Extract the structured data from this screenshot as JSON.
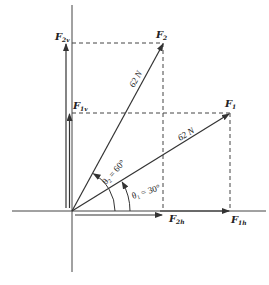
{
  "diagram": {
    "origin_px": [
      72,
      211
    ],
    "colors": {
      "line": "#333333",
      "dashed": "#444444",
      "background": "#ffffff"
    },
    "axes": {
      "x_axis": {
        "from_px": [
          12,
          211
        ],
        "to_px": [
          266,
          211
        ]
      },
      "y_axis": {
        "from_px": [
          72,
          5
        ],
        "to_px": [
          72,
          272
        ]
      }
    },
    "vectors": [
      {
        "name": "F1",
        "label": "F",
        "label_sub": "1",
        "magnitude_label": "62 N",
        "angle_label": "θ",
        "angle_sub": "1",
        "angle_value": " = 30°",
        "tip_px": [
          230,
          113
        ]
      },
      {
        "name": "F2",
        "label": "F",
        "label_sub": "2",
        "magnitude_label": "62 N",
        "angle_label": "θ",
        "angle_sub": "2",
        "angle_value": " = 60°",
        "tip_px": [
          163,
          43
        ]
      }
    ],
    "components": {
      "F1v": {
        "label": "F",
        "label_sub": "1v"
      },
      "F2v": {
        "label": "F",
        "label_sub": "2v"
      },
      "F1h": {
        "label": "F",
        "label_sub": "1h"
      },
      "F2h": {
        "label": "F",
        "label_sub": "2h"
      }
    }
  }
}
